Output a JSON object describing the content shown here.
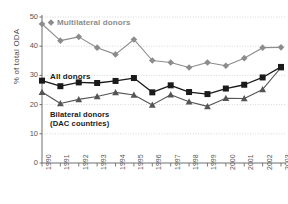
{
  "chart_data": {
    "type": "line",
    "title": "",
    "xlabel": "",
    "ylabel": "% of total ODA",
    "ylim": [
      0,
      50
    ],
    "yticks": [
      0,
      10,
      20,
      30,
      40,
      50
    ],
    "grid": true,
    "legend_position": "inline-annotations",
    "categories": [
      "1990",
      "1991",
      "1992",
      "1993",
      "1994",
      "1995",
      "1996",
      "1997",
      "1998",
      "1999",
      "2000",
      "2001",
      "2002",
      "2003"
    ],
    "series": [
      {
        "name": "Multilateral donors",
        "marker": "diamond",
        "color": "#8c8c8c",
        "values": [
          47.6,
          41.9,
          43.2,
          39.5,
          37.2,
          42.3,
          35.1,
          34.4,
          32.7,
          34.4,
          33.3,
          35.9,
          39.5,
          39.6
        ]
      },
      {
        "name": "All donors",
        "marker": "square",
        "color": "#1a1a1a",
        "values": [
          28.2,
          26.3,
          27.6,
          27.4,
          28.1,
          29.1,
          24.2,
          26.6,
          24.3,
          23.6,
          25.5,
          26.8,
          29.3,
          32.9
        ]
      },
      {
        "name": "Bilateral donors (DAC countries)",
        "marker": "triangle",
        "color": "#555555",
        "values": [
          24.3,
          20.4,
          21.8,
          22.8,
          24.2,
          23.3,
          19.9,
          23.4,
          21.0,
          19.4,
          22.2,
          22.1,
          25.2,
          32.7
        ]
      }
    ],
    "annotations": [
      {
        "id": "multilateral",
        "text": "Multilateral donors"
      },
      {
        "id": "all",
        "text": "All donors"
      },
      {
        "id": "bilateral_line1",
        "text": "Bilateral donors"
      },
      {
        "id": "bilateral_line2",
        "text": "(DAC countries)"
      }
    ]
  },
  "axis": {
    "y_title": "% of total ODA",
    "y_ticks": [
      "50",
      "40",
      "30",
      "20",
      "10",
      "0"
    ],
    "x_ticks": [
      "1990",
      "1991",
      "1992",
      "1993",
      "1994",
      "1995",
      "1996",
      "1997",
      "1998",
      "1999",
      "2000",
      "2001",
      "2002",
      "2003"
    ]
  },
  "colors": {
    "multilateral": "#8c8c8c",
    "all_donors": "#1a1a1a",
    "bilateral": "#555555",
    "grid": "#cccccc",
    "axis": "#6e6e6e",
    "background": "#ffffff"
  }
}
